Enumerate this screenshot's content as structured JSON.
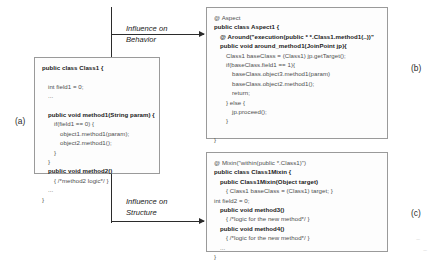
{
  "figure": {
    "part_labels": {
      "a": "(a)",
      "b": "(b)",
      "c": "(c)"
    },
    "annotations": {
      "behavior": "Influence on\nBehavior",
      "structure": "Influence on\nStructure"
    },
    "arrow_icons": {
      "behavior": "arrow-right-icon",
      "structure": "arrow-right-icon"
    },
    "colors": {
      "text": "#1b1b1b",
      "box_border": "#9a9a9a",
      "box_fill": "#fdfdfd",
      "connector": "#2b2b2b"
    }
  },
  "base_class_box": {
    "name": "base-class-code-box",
    "lines": [
      {
        "text": "public class Class1 {",
        "bold": true,
        "indent": 0
      },
      {
        "text": "",
        "bold": false,
        "indent": 0
      },
      {
        "text": "int field1 = 0;",
        "bold": false,
        "indent": 1
      },
      {
        "text": "...",
        "bold": false,
        "indent": 1
      },
      {
        "text": "",
        "bold": false,
        "indent": 0
      },
      {
        "text": "public void method1(String param) {",
        "bold": true,
        "indent": 1
      },
      {
        "text": "if(field1 == 0) {",
        "bold": false,
        "indent": 2
      },
      {
        "text": "object1.method1(param);",
        "bold": false,
        "indent": 3
      },
      {
        "text": "object2.method1();",
        "bold": false,
        "indent": 3
      },
      {
        "text": "}",
        "bold": false,
        "indent": 2
      },
      {
        "text": "}",
        "bold": false,
        "indent": 1
      },
      {
        "text": "public void method2()",
        "bold": true,
        "indent": 1
      },
      {
        "text": "{ /*method2 logic*/ }",
        "bold": false,
        "indent": 2
      },
      {
        "text": "...",
        "bold": false,
        "indent": 1
      },
      {
        "text": "}",
        "bold": false,
        "indent": 0
      }
    ]
  },
  "aspect_box": {
    "name": "aspect-code-box",
    "lines": [
      {
        "text": "@ Aspect",
        "bold": false,
        "indent": 0
      },
      {
        "text": "public class Aspect1 {",
        "bold": true,
        "indent": 0
      },
      {
        "text": "@ Around(\"execution(public * *.Class1.method1(..))\"",
        "bold": true,
        "indent": 1
      },
      {
        "text": "public void around_method1(JoinPoint jp){",
        "bold": true,
        "indent": 1
      },
      {
        "text": "Class1 baseClass = (Class1) jp.getTarget();",
        "bold": false,
        "indent": 2
      },
      {
        "text": "if(baseClass.field1 == 1){",
        "bold": false,
        "indent": 2
      },
      {
        "text": "baseClass.object3.method1(param)",
        "bold": false,
        "indent": 3
      },
      {
        "text": "baseClass.object2.method1();",
        "bold": false,
        "indent": 3
      },
      {
        "text": "return;",
        "bold": false,
        "indent": 3
      },
      {
        "text": "} else {",
        "bold": false,
        "indent": 2
      },
      {
        "text": "jp.proceed();",
        "bold": false,
        "indent": 3
      },
      {
        "text": "}",
        "bold": false,
        "indent": 2
      },
      {
        "text": "",
        "bold": false,
        "indent": 0
      },
      {
        "text": "}",
        "bold": false,
        "indent": 0
      }
    ]
  },
  "mixin_box": {
    "name": "mixin-code-box",
    "lines": [
      {
        "text": "@ Mixin(\"within(public *.Class1)\")",
        "bold": false,
        "indent": 0
      },
      {
        "text": "public class Class1Mixin {",
        "bold": true,
        "indent": 0
      },
      {
        "text": "public Class1Mixin(Object target)",
        "bold": true,
        "indent": 1
      },
      {
        "text": "{ Class1 baseClass = (Class1) target; }",
        "bold": false,
        "indent": 2
      },
      {
        "text": "int field2 = 0;",
        "bold": false,
        "indent": 0
      },
      {
        "text": "public void method3()",
        "bold": true,
        "indent": 1
      },
      {
        "text": "{ /*logic for the new method*/ }",
        "bold": false,
        "indent": 2
      },
      {
        "text": "public void method4()",
        "bold": true,
        "indent": 1
      },
      {
        "text": "{ /*logic for the new method*/ }",
        "bold": false,
        "indent": 2
      },
      {
        "text": "...",
        "bold": false,
        "indent": 1
      },
      {
        "text": "}",
        "bold": false,
        "indent": 0
      }
    ]
  },
  "specks": {
    "one": "~",
    "two": "~"
  }
}
